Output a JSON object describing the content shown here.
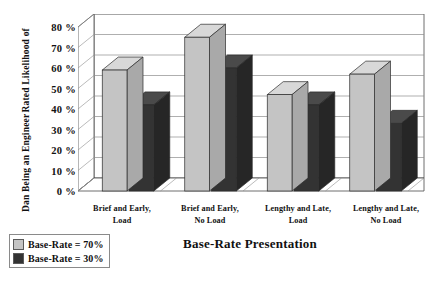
{
  "chart_data": {
    "type": "bar",
    "title": "",
    "xlabel": "Base-Rate Presentation",
    "ylabel_line1": "Rated Likelihood of",
    "ylabel_line2": "Dan Being an Engineer",
    "categories": [
      "Brief and Early, Load",
      "Brief and Early, No Load",
      "Lengthy and Late, Load",
      "Lengthy and Late, No Load"
    ],
    "category_lines": [
      [
        "Brief and Early,",
        "Load"
      ],
      [
        "Brief and Early,",
        "No Load"
      ],
      [
        "Lengthy and Late,",
        "Load"
      ],
      [
        "Lengthy and Late,",
        "No Load"
      ]
    ],
    "series": [
      {
        "name": "Base-Rate = 70%",
        "color": "#c4c4c4",
        "values": [
          59,
          75,
          47,
          57
        ]
      },
      {
        "name": "Base-Rate = 30%",
        "color": "#333333",
        "values": [
          42,
          60,
          42,
          33
        ]
      }
    ],
    "ylim": [
      0,
      80
    ],
    "ytick_values": [
      0,
      10,
      20,
      30,
      40,
      50,
      60,
      70,
      80
    ],
    "ytick_labels": [
      "0 %",
      "10 %",
      "20 %",
      "30 %",
      "40 %",
      "50 %",
      "60 %",
      "70 %",
      "80 %"
    ],
    "grid": true,
    "grid_axis": "y",
    "legend_position": "below-left",
    "style": "3d-column"
  },
  "legend": {
    "items": [
      {
        "label": "Base-Rate = 70%",
        "color": "#c4c4c4"
      },
      {
        "label": "Base-Rate = 30%",
        "color": "#333333"
      }
    ]
  }
}
